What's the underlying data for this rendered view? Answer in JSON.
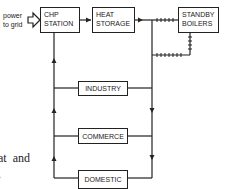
{
  "diagram": {
    "external_label": "power\nto grid",
    "nodes": [
      {
        "id": "chp",
        "label": "CHP\nSTATION"
      },
      {
        "id": "heat",
        "label": "HEAT\nSTORAGE"
      },
      {
        "id": "standby",
        "label": "STANDBY\nBOILERS"
      },
      {
        "id": "industry",
        "label": "INDUSTRY"
      },
      {
        "id": "commerce",
        "label": "COMMERCE"
      },
      {
        "id": "domestic",
        "label": "DOMESTIC"
      }
    ],
    "edges": [
      {
        "from": "chp",
        "to": "grid",
        "style": "hollow-arrow"
      },
      {
        "from": "chp",
        "to": "heat",
        "style": "arrow"
      },
      {
        "from": "heat",
        "to": "standby",
        "style": "hatched"
      },
      {
        "from": "standby",
        "to": "supply-line",
        "style": "hatched"
      },
      {
        "from": "heat",
        "to": "industry",
        "style": "arrow"
      },
      {
        "from": "heat",
        "to": "commerce",
        "style": "arrow"
      },
      {
        "from": "heat",
        "to": "domestic",
        "style": "arrow"
      },
      {
        "from": "domestic",
        "to": "chp",
        "style": "return-arrow"
      }
    ],
    "page_fragment": "at  and\n."
  }
}
